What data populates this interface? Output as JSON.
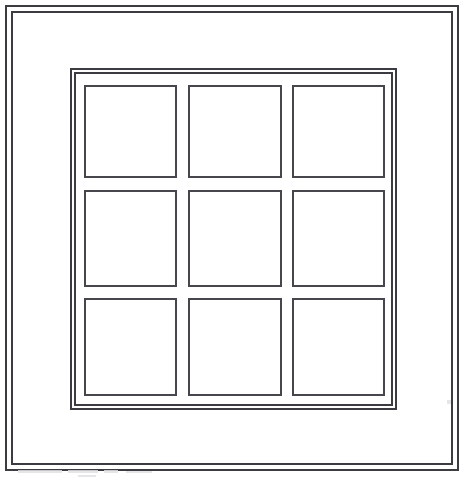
{
  "figure": {
    "kind": "line-drawing",
    "width": 467,
    "height": 478,
    "background_color": "#ffffff",
    "line_color": "#3b3b41",
    "pane_line_color": "#46464c",
    "text_content": "",
    "labels": []
  },
  "frames": [
    {
      "name": "outer-border-outer-line",
      "x": 5,
      "y": 5,
      "width": 454,
      "height": 466,
      "stroke": "#3b3b41",
      "stroke_width": 2,
      "fill": "none"
    },
    {
      "name": "outer-border-inner-line",
      "x": 11,
      "y": 11,
      "width": 442,
      "height": 454,
      "stroke": "#3b3b41",
      "stroke_width": 2,
      "fill": "none"
    },
    {
      "name": "grid-frame-outer-line",
      "x": 70,
      "y": 68,
      "width": 327,
      "height": 342,
      "stroke": "#3b3b41",
      "stroke_width": 2,
      "fill": "none"
    },
    {
      "name": "grid-frame-inner-line",
      "x": 74,
      "y": 72,
      "width": 319,
      "height": 334,
      "stroke": "#3b3b41",
      "stroke_width": 2,
      "fill": "none"
    }
  ],
  "grid": {
    "rows": 3,
    "columns": 3,
    "cell_count": 9,
    "origin_x": 84,
    "origin_y": 85,
    "total_width": 301,
    "total_height": 311,
    "column_gap": 11,
    "row_gap": 11,
    "stroke": "#46464c",
    "stroke_width": 2,
    "fill": "#ffffff",
    "column_positions": [
      0,
      104,
      208
    ],
    "column_widths": [
      93,
      94,
      93
    ],
    "row_positions": [
      0,
      105,
      213
    ],
    "row_heights": [
      93,
      97,
      98
    ],
    "cells": [
      {
        "id": "pane-r1c1",
        "row": 1,
        "column": 1,
        "label": ""
      },
      {
        "id": "pane-r1c2",
        "row": 1,
        "column": 2,
        "label": ""
      },
      {
        "id": "pane-r1c3",
        "row": 1,
        "column": 3,
        "label": ""
      },
      {
        "id": "pane-r2c1",
        "row": 2,
        "column": 1,
        "label": ""
      },
      {
        "id": "pane-r2c2",
        "row": 2,
        "column": 2,
        "label": ""
      },
      {
        "id": "pane-r2c3",
        "row": 2,
        "column": 3,
        "label": ""
      },
      {
        "id": "pane-r3c1",
        "row": 3,
        "column": 1,
        "label": ""
      },
      {
        "id": "pane-r3c2",
        "row": 3,
        "column": 2,
        "label": ""
      },
      {
        "id": "pane-r3c3",
        "row": 3,
        "column": 3,
        "label": ""
      }
    ]
  },
  "artifacts": {
    "description": "faint light-gray scan marks near the bottom edge",
    "color": "#e2e2e4",
    "marks": [
      {
        "x": 18,
        "y": 470,
        "width": 44,
        "height": 3
      },
      {
        "x": 68,
        "y": 470,
        "width": 30,
        "height": 3
      },
      {
        "x": 104,
        "y": 470,
        "width": 14,
        "height": 3
      },
      {
        "x": 126,
        "y": 471,
        "width": 26,
        "height": 2
      },
      {
        "x": 78,
        "y": 475,
        "width": 18,
        "height": 2
      },
      {
        "x": 447,
        "y": 400,
        "width": 4,
        "height": 4
      }
    ]
  }
}
